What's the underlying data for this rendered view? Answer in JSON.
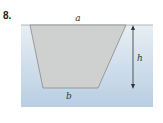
{
  "problem": {
    "number": "8."
  },
  "diagram": {
    "labels": {
      "top": "a",
      "bottom": "b",
      "height": "h"
    },
    "colors": {
      "water_top": "#e6edf3",
      "water_bottom": "#b9cfe3",
      "trapezoid_fill": "#cfd0d0",
      "trapezoid_stroke": "#8a8a8a",
      "arrow": "#333333"
    }
  }
}
